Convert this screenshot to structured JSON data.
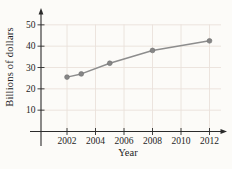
{
  "chart_data": {
    "type": "line",
    "title": "",
    "xlabel": "Year",
    "ylabel": "Billions of dollars",
    "x": [
      2002,
      2003,
      2005,
      2008,
      2012
    ],
    "values": [
      25.5,
      27,
      32,
      38,
      42.5
    ],
    "series": [
      {
        "name": "Billions of dollars",
        "x": [
          2002,
          2003,
          2005,
          2008,
          2012
        ],
        "values": [
          25.5,
          27,
          32,
          38,
          42.5
        ]
      }
    ],
    "x_ticks": [
      2002,
      2004,
      2006,
      2008,
      2010,
      2012
    ],
    "y_ticks": [
      10,
      20,
      30,
      40,
      50
    ],
    "xlim": [
      2000,
      2013.5
    ],
    "ylim": [
      0,
      56
    ],
    "grid": true,
    "legend_position": "none",
    "marker": "circle",
    "colors": {
      "line": "#8d8d8d",
      "marker_fill": "#868686",
      "marker_stroke": "#6e6e6e",
      "axis": "#2b2b2b",
      "grid": "#eae1da",
      "tick_text": "#1e1e1e",
      "background": "#fcfbf8"
    }
  }
}
